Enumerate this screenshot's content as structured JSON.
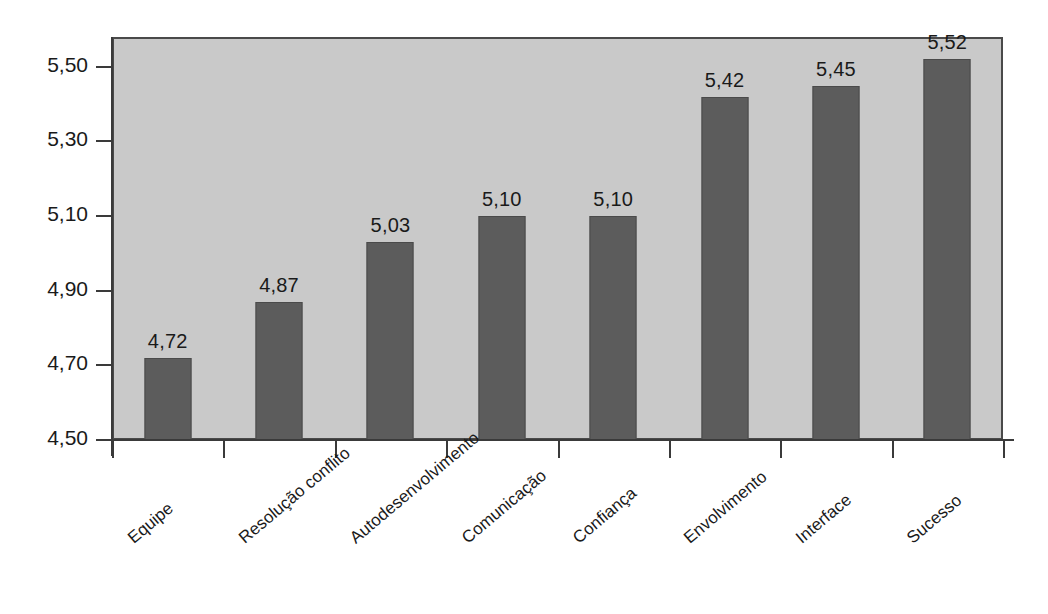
{
  "chart_data": {
    "type": "bar",
    "title": "",
    "subtitle": "",
    "xlabel": "",
    "ylabel": "",
    "categories": [
      "Equipe",
      "Resolução conflito",
      "Autodesenvolvimento",
      "Comunicação",
      "Confiança",
      "Envolvimento",
      "Interface",
      "Sucesso"
    ],
    "values": [
      4.72,
      4.87,
      5.03,
      5.1,
      5.1,
      5.42,
      5.45,
      5.52
    ],
    "value_labels": [
      "4,72",
      "4,87",
      "5,03",
      "5,10",
      "5,10",
      "5,42",
      "5,45",
      "5,52"
    ],
    "ylim": [
      4.5,
      5.58
    ],
    "y_ticks": [
      4.5,
      4.7,
      4.9,
      5.1,
      5.3,
      5.5
    ],
    "y_tick_labels": [
      "4,50",
      "4,70",
      "4,90",
      "5,10",
      "5,30",
      "5,50"
    ],
    "grid": false,
    "legend": "none",
    "decimal_separator": ",",
    "series": [
      {
        "name": "",
        "values": [
          4.72,
          4.87,
          5.03,
          5.1,
          5.1,
          5.42,
          5.45,
          5.52
        ]
      }
    ],
    "colors": {
      "bar_fill": "#5c5c5c",
      "bar_edge": "#4a4a4a",
      "plot_background": "#c9c9c9",
      "plot_border": "#4a4a4a",
      "figure_background": "#ffffff",
      "axis_line": "#3a3a3a",
      "text": "#1a1a1a"
    }
  }
}
